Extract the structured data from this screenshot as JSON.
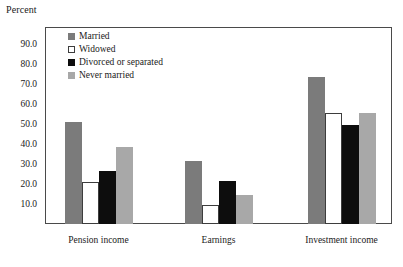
{
  "axis_title": "Percent",
  "chart_data": {
    "type": "bar",
    "title": "",
    "subtitle": "",
    "xlabel": "",
    "ylabel": "Percent",
    "ylim": [
      0,
      95
    ],
    "yticks": [
      "10.0",
      "20.0",
      "30.0",
      "40.0",
      "50.0",
      "60.0",
      "70.0",
      "80.0",
      "90.0"
    ],
    "ytick_values": [
      10,
      20,
      30,
      40,
      50,
      60,
      70,
      80,
      90
    ],
    "grid": false,
    "legend_position": "inside-top-left",
    "categories": [
      "Pension income",
      "Earnings",
      "Investment income"
    ],
    "series": [
      {
        "name": "Married",
        "color": "#7b7b7b",
        "values": [
          51.0,
          31.5,
          73.5
        ]
      },
      {
        "name": "Widowed",
        "color": "#ffffff",
        "values": [
          21.0,
          9.5,
          55.5
        ]
      },
      {
        "name": "Divorced or separated",
        "color": "#0d0d0d",
        "values": [
          26.5,
          21.5,
          49.5
        ]
      },
      {
        "name": "Never married",
        "color": "#a8a8a8",
        "values": [
          38.5,
          14.5,
          55.5
        ]
      }
    ]
  }
}
